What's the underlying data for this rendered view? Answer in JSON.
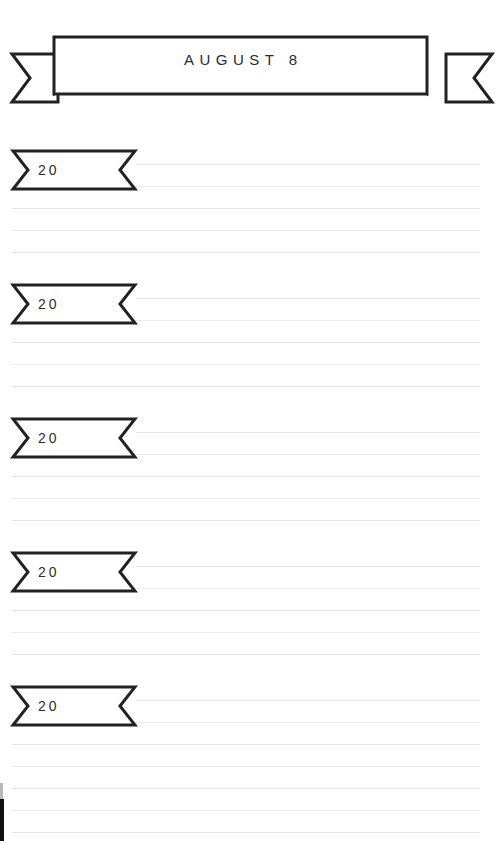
{
  "page": {
    "width": 504,
    "height": 859,
    "background": "#ffffff",
    "ink_color": "#222225",
    "rule_color": "#e4e4e6"
  },
  "header": {
    "name": "ribbon-banner",
    "title": "AUGUST 8",
    "shape": "ribbon-banner-with-forked-tails"
  },
  "entries": [
    {
      "label": "20",
      "flag_top": 148,
      "line_count": 5
    },
    {
      "label": "20",
      "flag_top": 282,
      "line_count": 5
    },
    {
      "label": "20",
      "flag_top": 416,
      "line_count": 5
    },
    {
      "label": "20",
      "flag_top": 550,
      "line_count": 5
    },
    {
      "label": "20",
      "flag_top": 684,
      "line_count": 5
    }
  ],
  "rules": {
    "first_line_left": 136,
    "full_line_left": 12,
    "line_right": 480,
    "line_spacing": 22
  },
  "artifacts": {
    "scan_edge": "dark-scan-edge-bottom-left"
  }
}
